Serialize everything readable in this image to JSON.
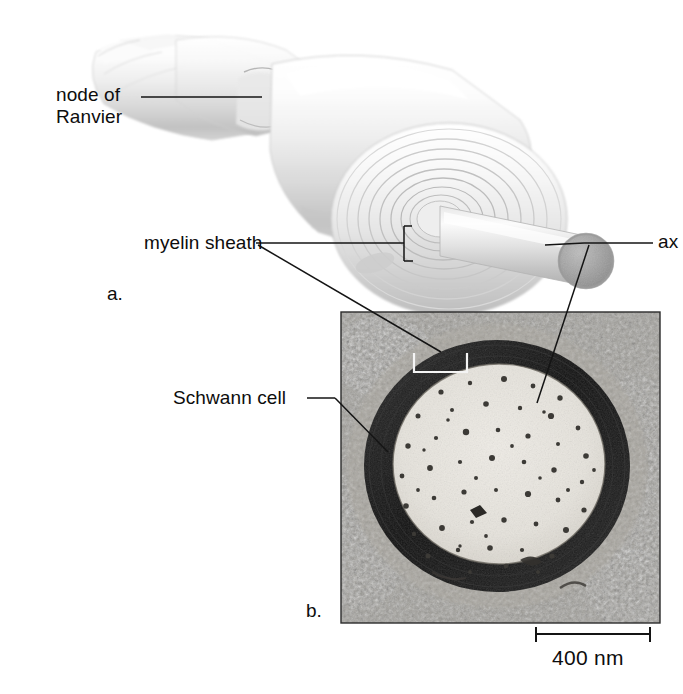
{
  "figure": {
    "type": "biology-diagram",
    "panels": [
      {
        "id": "a",
        "label": "a.",
        "kind": "illustration",
        "description": "three-dimensional drawing of a myelinated axon with cut-away myelin spiral"
      },
      {
        "id": "b",
        "label": "b.",
        "kind": "electron-micrograph",
        "description": "cross-section transmission electron micrograph of a myelinated axon"
      }
    ]
  },
  "labels": {
    "node_of_ranvier": {
      "line1": "node of",
      "line2": "Ranvier"
    },
    "myelin_sheath": "myelin sheath",
    "schwann_cell": "Schwann cell",
    "axon": "ax"
  },
  "panel_labels": {
    "a": "a.",
    "b": "b."
  },
  "scale_bar": {
    "value": "400",
    "unit": "nm",
    "text": "400 nm",
    "length_px": 116
  },
  "colors": {
    "background": "#ffffff",
    "ink": "#0d0d0d",
    "leader_line": "#1a1a1a",
    "illustration_light": "#f2f2f2",
    "illustration_shadow": "#b9b9b9",
    "axon_disc": "#9a9a9a",
    "micrograph_myelin": "#1d1d1d",
    "micrograph_axoplasm": "#e4e2dd",
    "micrograph_matrix": "#8f8d88"
  }
}
